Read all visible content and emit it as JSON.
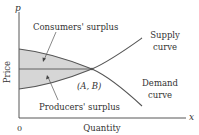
{
  "diagram": {
    "axes": {
      "y_label": "p",
      "x_label": "x",
      "y_title": "Price",
      "x_title": "Quantity",
      "origin_label": "0"
    },
    "curves": {
      "supply_label_line1": "Supply",
      "supply_label_line2": "curve",
      "demand_label_line1": "Demand",
      "demand_label_line2": "curve"
    },
    "regions": {
      "consumers_surplus": "Consumers' surplus",
      "producers_surplus": "Producers' surplus"
    },
    "equilibrium_label": "(A, B)",
    "colors": {
      "fill": "#d6d6d6",
      "line": "#555555",
      "axis": "#444444"
    }
  }
}
